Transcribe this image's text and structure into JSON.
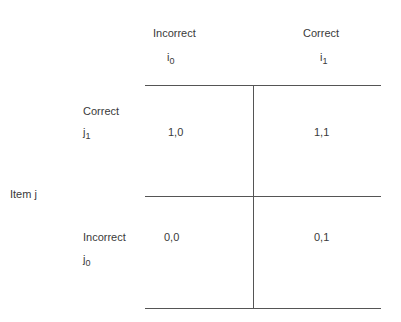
{
  "item_i_columns": [
    {
      "label": "Incorrect",
      "symbol": "i",
      "subscript": "0"
    },
    {
      "label": "Correct",
      "symbol": "i",
      "subscript": "1"
    }
  ],
  "item_j": {
    "label": "Item j",
    "rows": [
      {
        "label": "Correct",
        "symbol": "j",
        "subscript": "1"
      },
      {
        "label": "Incorrect",
        "symbol": "j",
        "subscript": "0"
      }
    ]
  },
  "cells": [
    [
      "1,0",
      "1,1"
    ],
    [
      "0,0",
      "0,1"
    ]
  ]
}
